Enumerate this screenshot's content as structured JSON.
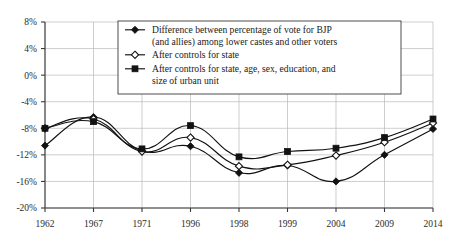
{
  "chart_data": {
    "type": "line",
    "title": "",
    "subtitle": "",
    "xlabel": "",
    "ylabel": "",
    "categories": [
      "1962",
      "1967",
      "1971",
      "1996",
      "1998",
      "1999",
      "2004",
      "2009",
      "2014"
    ],
    "ylim": [
      -20,
      8
    ],
    "yticks": [
      8,
      4,
      0,
      -4,
      -8,
      -12,
      -16,
      -20
    ],
    "ytick_labels": [
      "8%",
      "4%",
      "0%",
      "-4%",
      "-8%",
      "-12%",
      "-16%",
      "-20%"
    ],
    "grid": true,
    "legend_position": "top-center",
    "series": [
      {
        "name": "Difference between percentage of vote for BJP (and allies) among lower castes and other voters",
        "marker": "filled-diamond",
        "values": [
          -10.6,
          -6.3,
          -11.4,
          -10.7,
          -14.7,
          -13.6,
          -16.0,
          -12.0,
          -8.1
        ]
      },
      {
        "name": "After controls for state",
        "marker": "open-diamond",
        "values": [
          -8.0,
          -6.6,
          -11.5,
          -9.4,
          -13.7,
          -13.5,
          -12.1,
          -10.1,
          -7.2
        ]
      },
      {
        "name": "After controls for state, age, sex, education, and size of urban unit",
        "marker": "filled-square",
        "values": [
          -8.0,
          -7.0,
          -11.1,
          -7.6,
          -12.3,
          -11.5,
          -11.0,
          -9.4,
          -6.6
        ]
      }
    ]
  },
  "legend": {
    "entries": [
      {
        "marker": "filled-diamond",
        "line1": "Difference between percentage of vote for BJP",
        "line2": "(and allies) among lower castes and other voters"
      },
      {
        "marker": "open-diamond",
        "line1": "After controls for state",
        "line2": ""
      },
      {
        "marker": "filled-square",
        "line1": "After controls for state, age, sex, education, and",
        "line2": "size of urban unit"
      }
    ]
  },
  "axes": {
    "y_tick_labels": [
      "8%",
      "4%",
      "0%",
      "-4%",
      "-8%",
      "-12%",
      "-16%",
      "-20%"
    ],
    "x_tick_labels": [
      "1962",
      "1967",
      "1971",
      "1996",
      "1998",
      "1999",
      "2004",
      "2009",
      "2014"
    ]
  },
  "colors": {
    "ink": "#121212",
    "grid": "#b9b9b9",
    "axis": "#3a3a3a",
    "background": "#ffffff"
  }
}
